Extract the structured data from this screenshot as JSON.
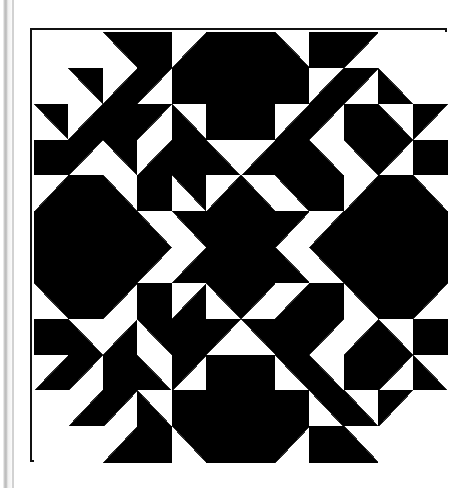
{
  "page": {
    "width": 474,
    "height": 488,
    "background_color": "#ffffff"
  },
  "page_edge": {
    "name": "left-page-edge-shadow",
    "color": "#cfcfcf"
  },
  "quilt": {
    "title": "",
    "frame": {
      "x": 30,
      "y": 28,
      "width": 417,
      "height": 434,
      "border_color": "#111111",
      "border_width": 2
    },
    "colors": {
      "dark": "#000000",
      "light": "#ffffff",
      "seam": "#2a2a2a"
    },
    "grid": {
      "columns": 12,
      "rows": 12,
      "cell_width": 34.42,
      "cell_height": 35.83,
      "unit_type": "half-square-triangle",
      "legend": {
        "F": "full-dark-square",
        "E": "empty-light-square",
        "NW": "dark-triangle-top-left",
        "NE": "dark-triangle-top-right",
        "SE": "dark-triangle-bottom-right",
        "SW": "dark-triangle-bottom-left"
      }
    },
    "pattern_name": "double-x-sawtooth-block",
    "symmetry": "four-way mirror (horizontal and vertical axes)",
    "cells": [
      [
        "E",
        "E",
        "SE",
        "F",
        "NE",
        "F",
        "F",
        "NW",
        "F",
        "SW",
        "E",
        "E"
      ],
      [
        "E",
        "SE",
        "NE",
        "SW",
        "F",
        "F",
        "F",
        "F",
        "NE",
        "SW",
        "NW",
        "E"
      ],
      [
        "SE",
        "NE",
        "F",
        "SW",
        "NW",
        "F",
        "F",
        "NE",
        "SW",
        "F",
        "NW",
        "SW"
      ],
      [
        "F",
        "SW",
        "SE",
        "NE",
        "F",
        "NW",
        "NE",
        "F",
        "NW",
        "SE",
        "SW",
        "F"
      ],
      [
        "NE",
        "F",
        "NW",
        "F",
        "SE",
        "NE",
        "NW",
        "SE",
        "F",
        "NE",
        "F",
        "NW"
      ],
      [
        "F",
        "F",
        "F",
        "NW",
        "SE",
        "F",
        "F",
        "SW",
        "NE",
        "F",
        "F",
        "F"
      ],
      [
        "F",
        "F",
        "F",
        "SW",
        "NE",
        "F",
        "F",
        "NW",
        "SE",
        "F",
        "F",
        "F"
      ],
      [
        "SE",
        "F",
        "SW",
        "F",
        "NE",
        "SE",
        "SW",
        "NE",
        "F",
        "SE",
        "F",
        "SW"
      ],
      [
        "F",
        "NW",
        "NE",
        "SE",
        "F",
        "SW",
        "SE",
        "F",
        "SW",
        "NE",
        "NW",
        "F"
      ],
      [
        "NE",
        "SW",
        "F",
        "NW",
        "SW",
        "F",
        "F",
        "SE",
        "NW",
        "F",
        "SW",
        "NW"
      ],
      [
        "E",
        "NE",
        "SW",
        "NW",
        "F",
        "F",
        "F",
        "F",
        "SE",
        "NW",
        "SW",
        "E"
      ],
      [
        "E",
        "E",
        "NE",
        "F",
        "SE",
        "F",
        "F",
        "SW",
        "F",
        "NW",
        "E",
        "E"
      ]
    ]
  }
}
